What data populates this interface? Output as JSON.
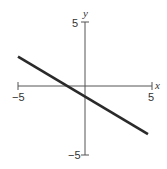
{
  "chart_data": {
    "type": "line",
    "title": "",
    "xlabel": "x",
    "ylabel": "y",
    "xlim": [
      -5,
      5
    ],
    "ylim": [
      -5,
      5
    ],
    "grid": false,
    "x_ticks": [
      -5,
      5
    ],
    "y_ticks": [
      -5,
      5
    ],
    "x_tick_labels": [
      "−5",
      "5"
    ],
    "y_tick_labels": [
      "−5",
      "5"
    ],
    "series": [
      {
        "name": "line",
        "equation": "y = -0.6x - 0.8",
        "slope": -0.6,
        "intercept": -0.8,
        "x": [
          -5,
          4.7
        ],
        "y": [
          2.2,
          -3.62
        ]
      }
    ]
  },
  "labels": {
    "x_axis": "x",
    "y_axis": "y",
    "x_min": "−5",
    "x_max": "5",
    "y_min": "−5",
    "y_max": "5"
  },
  "colors": {
    "axis": "#555555",
    "line": "#2a2a2a",
    "text": "#333333"
  }
}
